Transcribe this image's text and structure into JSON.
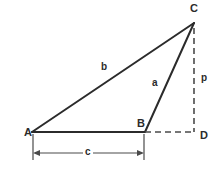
{
  "figure": {
    "kind": "geometry-diagram",
    "background_color": "#ffffff",
    "stroke_color": "#2b2b2b",
    "vertices": {
      "A": {
        "label": "A",
        "x": 32,
        "y": 132
      },
      "B": {
        "label": "B",
        "x": 145,
        "y": 132
      },
      "C": {
        "label": "C",
        "x": 194,
        "y": 23
      },
      "D": {
        "label": "D",
        "x": 194,
        "y": 132
      }
    },
    "sides": {
      "a": {
        "label": "a",
        "from": "B",
        "to": "C",
        "style": "solid"
      },
      "b": {
        "label": "b",
        "from": "A",
        "to": "C",
        "style": "solid"
      },
      "c": {
        "label": "c",
        "from": "A",
        "to": "B",
        "style": "solid"
      },
      "p": {
        "label": "p",
        "from": "C",
        "to": "D",
        "style": "dashed"
      }
    },
    "construction_lines": [
      {
        "name": "BD-extension",
        "from": "B",
        "to": "D",
        "style": "dashed"
      },
      {
        "name": "CD-altitude",
        "from": "C",
        "to": "D",
        "style": "dashed"
      }
    ],
    "dimension": {
      "label": "c",
      "measures": "AB",
      "start_x": 33,
      "end_x": 144,
      "y": 153,
      "arrowheads": "both"
    }
  }
}
